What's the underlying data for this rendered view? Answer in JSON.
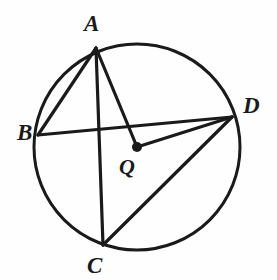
{
  "figure": {
    "background_color": "#fefefe",
    "stroke_color": "#1a1a1a",
    "canvas": {
      "width": 277,
      "height": 280
    }
  },
  "circle": {
    "name": "circle-Q",
    "center_label": "Q",
    "cx": 137,
    "cy": 147,
    "r": 103,
    "stroke_width": 3
  },
  "center_point": {
    "label": "Q",
    "x": 137,
    "y": 147,
    "dot_radius": 5,
    "fill": "#1a1a1a"
  },
  "points": [
    {
      "label": "A",
      "x": 96,
      "y": 48,
      "label_x": 84,
      "label_y": 12
    },
    {
      "label": "B",
      "x": 38,
      "y": 135,
      "label_x": 17,
      "label_y": 121
    },
    {
      "label": "C",
      "x": 103,
      "y": 245,
      "label_x": 87,
      "label_y": 254
    },
    {
      "label": "D",
      "x": 232,
      "y": 117,
      "label_x": 243,
      "label_y": 94
    }
  ],
  "segments": [
    {
      "name": "chord-AB",
      "from": "A",
      "to": "B",
      "x1": 96,
      "y1": 48,
      "x2": 38,
      "y2": 135
    },
    {
      "name": "chord-AC",
      "from": "A",
      "to": "C",
      "x1": 96,
      "y1": 48,
      "x2": 103,
      "y2": 245
    },
    {
      "name": "radius-AQ",
      "from": "A",
      "to": "Q",
      "x1": 96,
      "y1": 48,
      "x2": 137,
      "y2": 147
    },
    {
      "name": "chord-BD",
      "from": "B",
      "to": "D",
      "x1": 38,
      "y1": 135,
      "x2": 232,
      "y2": 117
    },
    {
      "name": "radius-QD",
      "from": "Q",
      "to": "D",
      "x1": 137,
      "y1": 147,
      "x2": 232,
      "y2": 117
    },
    {
      "name": "chord-CD",
      "from": "C",
      "to": "D",
      "x1": 103,
      "y1": 245,
      "x2": 232,
      "y2": 117
    }
  ],
  "labels": {
    "A": "A",
    "B": "B",
    "C": "C",
    "D": "D",
    "Q": "Q"
  }
}
